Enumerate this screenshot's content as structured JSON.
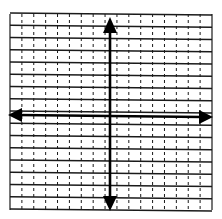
{
  "diagram": {
    "type": "coordinate-plane",
    "grid": {
      "columns": 17,
      "rows": 16,
      "horizontal_line_style": "solid",
      "vertical_line_style": "dashed",
      "line_color": "#1a1a1a",
      "background": "#ffffff"
    },
    "axes": {
      "x_axis": {
        "arrows": "both",
        "color": "#000000"
      },
      "y_axis": {
        "arrows": "both",
        "color": "#000000"
      },
      "labels": []
    },
    "tick_labels": []
  }
}
